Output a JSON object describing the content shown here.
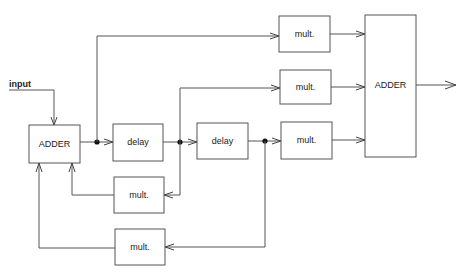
{
  "diagram": {
    "input_label": "input",
    "blocks": {
      "adder_input": "ADDER",
      "delay_1": "delay",
      "delay_2": "delay",
      "mult_forward_1": "mult.",
      "mult_forward_2": "mult.",
      "mult_forward_3": "mult.",
      "adder_output": "ADDER",
      "mult_feedback_1": "mult.",
      "mult_feedback_2": "mult."
    },
    "colors": {
      "line": "#555555",
      "junction": "#111111",
      "background": "#ffffff"
    }
  }
}
